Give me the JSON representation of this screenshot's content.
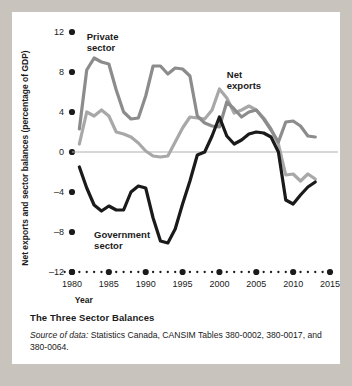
{
  "figure": {
    "caption_title": "The Three Sector Balances",
    "source_lead": "Source of data:",
    "source_text": " Statistics Canada, CANSIM Tables 380-0002, 380-0017, and 380-0064."
  },
  "colors": {
    "private_sector": "#8c8c8c",
    "net_exports": "#a8a8a8",
    "government_sector": "#1a1a1a",
    "zero_line": "#b0b0b0",
    "axis": "#1b1b1b",
    "page_background": "#c8c4bd",
    "figure_background": "#ffffff"
  },
  "chart_data": {
    "type": "line",
    "title": "The Three Sector Balances",
    "xlabel": "Year",
    "ylabel": "Net exports and sector balances (percentage of GDP)",
    "xlim": [
      1979,
      2015
    ],
    "ylim": [
      -12,
      12
    ],
    "xticks": [
      1980,
      1985,
      1990,
      1995,
      2000,
      2005,
      2010,
      2015
    ],
    "yticks": [
      12,
      8,
      4,
      0,
      -4,
      -8,
      -12
    ],
    "grid": false,
    "zero_line": true,
    "legend": "inline-annotations",
    "annotations": [
      {
        "text": "Private sector",
        "series": "Private sector",
        "x": 1982,
        "y": 11.2
      },
      {
        "text": "Net exports",
        "series": "Net exports",
        "x": 2001,
        "y": 7.4
      },
      {
        "text": "Government sector",
        "series": "Government sector",
        "x": 1983,
        "y": -8.6
      }
    ],
    "x": [
      1981,
      1982,
      1983,
      1984,
      1985,
      1986,
      1987,
      1988,
      1989,
      1990,
      1991,
      1992,
      1993,
      1994,
      1995,
      1996,
      1997,
      1998,
      1999,
      2000,
      2001,
      2002,
      2003,
      2004,
      2005,
      2006,
      2007,
      2008,
      2009,
      2010,
      2011,
      2012,
      2013
    ],
    "series": [
      {
        "name": "Private sector",
        "color": "#8c8c8c",
        "values": [
          2.3,
          8.2,
          9.4,
          9.0,
          8.8,
          6.2,
          4.0,
          3.3,
          3.4,
          5.6,
          8.6,
          8.6,
          7.8,
          8.4,
          8.3,
          7.6,
          3.6,
          2.9,
          2.6,
          2.5,
          5.0,
          4.3,
          3.5,
          4.0,
          4.2,
          3.3,
          2.2,
          1.0,
          3.0,
          3.1,
          2.6,
          1.6,
          1.5
        ]
      },
      {
        "name": "Net exports",
        "color": "#a8a8a8",
        "values": [
          0.8,
          4.0,
          3.6,
          4.2,
          3.6,
          2.0,
          1.8,
          1.5,
          0.9,
          0.1,
          -0.4,
          -0.5,
          -0.4,
          1.0,
          2.4,
          3.5,
          3.4,
          3.3,
          4.2,
          6.3,
          5.4,
          3.9,
          4.2,
          4.6,
          4.2,
          3.4,
          2.3,
          0.8,
          -2.3,
          -2.2,
          -2.9,
          -2.2,
          -2.7
        ]
      },
      {
        "name": "Government sector",
        "color": "#1a1a1a",
        "values": [
          -1.5,
          -3.6,
          -5.3,
          -5.9,
          -5.4,
          -5.8,
          -5.8,
          -4.0,
          -3.4,
          -3.6,
          -6.6,
          -8.9,
          -9.1,
          -7.7,
          -5.2,
          -2.9,
          -0.3,
          0.0,
          1.6,
          3.5,
          1.6,
          0.8,
          1.2,
          1.8,
          2.0,
          1.9,
          1.5,
          0.0,
          -4.8,
          -5.2,
          -4.3,
          -3.5,
          -3.0
        ]
      }
    ]
  }
}
